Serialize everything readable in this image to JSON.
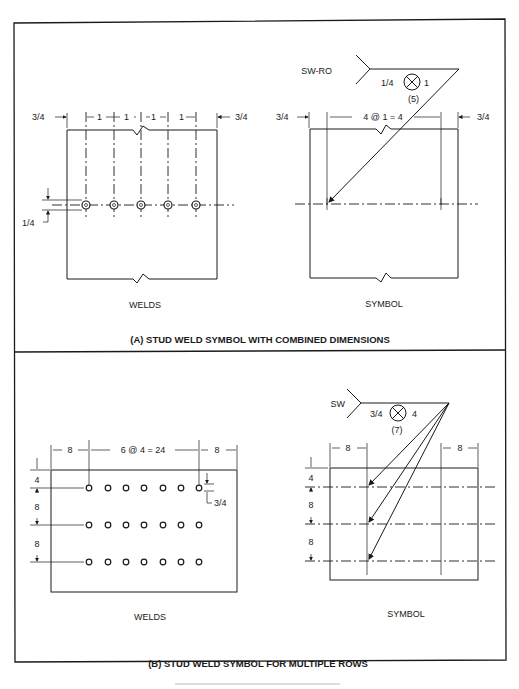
{
  "panel_a": {
    "title": "(A) STUD WELD SYMBOL WITH COMBINED DIMENSIONS",
    "welds": {
      "caption": "WELDS",
      "left_edge": "3/4",
      "spacings": [
        "1",
        "1",
        "1",
        "1"
      ],
      "right_edge": "3/4",
      "stud_diameter": "1/4",
      "stud_count": 5
    },
    "symbol": {
      "caption": "SYMBOL",
      "tail_text": "SW-RO",
      "size": "1/4",
      "pitch": "1",
      "count": "(5)",
      "left_edge": "3/4",
      "spacing_dim": "4 @ 1 = 4",
      "right_edge": "3/4"
    }
  },
  "panel_b": {
    "title": "(B) STUD WELD SYMBOL FOR MULTIPLE ROWS",
    "welds": {
      "caption": "WELDS",
      "left_edge": "8",
      "spacing_dim": "6 @ 4 = 24",
      "right_edge": "8",
      "row_top": "4",
      "row_gap_1": "8",
      "row_gap_2": "8",
      "stud_diameter": "3/4",
      "rows": 3,
      "studs_per_row": 7
    },
    "symbol": {
      "caption": "SYMBOL",
      "tail_text": "SW",
      "size": "3/4",
      "pitch": "4",
      "count": "(7)",
      "left_edge": "8",
      "right_edge": "8",
      "row_top": "4",
      "row_gap_1": "8",
      "row_gap_2": "8"
    }
  }
}
